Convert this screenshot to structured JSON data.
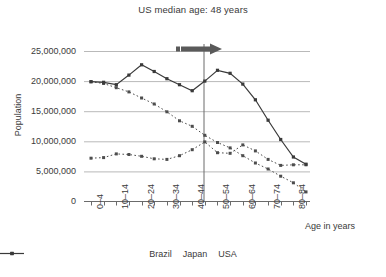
{
  "chart_data": {
    "type": "line",
    "title": "US median age: 48 years",
    "xlabel": "Age in years",
    "ylabel": "Population",
    "ylim": [
      0,
      25000000
    ],
    "yticks": [
      0,
      5000000,
      10000000,
      15000000,
      20000000,
      25000000
    ],
    "ytick_labels": [
      "0",
      "5,000,000",
      "10,000,000",
      "15,000,000",
      "20,000,000",
      "25,000,000"
    ],
    "grid": true,
    "legend_position": "bottom",
    "categories": [
      "0–4",
      "5–9",
      "10–14",
      "15–19",
      "20–24",
      "25–29",
      "30–34",
      "35–39",
      "40–44",
      "45–49",
      "50–54",
      "55–59",
      "60–64",
      "65–69",
      "70–74",
      "75–79",
      "80–84",
      "85+"
    ],
    "xtick_labels_shown": [
      "0–4",
      "10–14",
      "20–24",
      "30–34",
      "40–44",
      "50–54",
      "60–64",
      "70–74",
      "80–84"
    ],
    "series": [
      {
        "name": "Brazil",
        "style": "dotted",
        "marker": "square",
        "color": "#4d4d4d",
        "values": [
          7200000,
          7300000,
          7900000,
          7800000,
          7500000,
          7100000,
          7000000,
          7600000,
          8600000,
          9900000,
          8100000,
          8000000,
          9400000,
          8400000,
          7000000,
          6000000,
          6100000,
          6100000
        ]
      },
      {
        "name": "Japan",
        "style": "dotted",
        "marker": "square",
        "color": "#4d4d4d",
        "values": [
          19900000,
          19600000,
          18900000,
          18200000,
          17200000,
          16200000,
          14900000,
          13400000,
          12500000,
          11000000,
          9800000,
          8900000,
          7600000,
          6400000,
          5400000,
          4200000,
          3100000,
          1600000
        ]
      },
      {
        "name": "USA",
        "style": "solid",
        "marker": "square",
        "color": "#3a3a3a",
        "values": [
          19900000,
          19800000,
          19400000,
          21000000,
          22700000,
          21600000,
          20400000,
          19400000,
          18400000,
          20000000,
          21800000,
          21300000,
          19500000,
          16900000,
          13500000,
          10300000,
          7400000,
          6200000
        ]
      }
    ],
    "annotation": {
      "label": "median-age-marker",
      "arrow_direction": "right",
      "vertical_line_at_category": "50–54"
    }
  },
  "legend": {
    "items": [
      {
        "label": "Brazil"
      },
      {
        "label": "Japan"
      },
      {
        "label": "USA"
      }
    ]
  }
}
